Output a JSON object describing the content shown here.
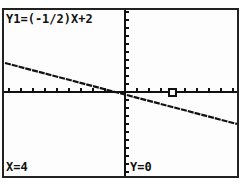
{
  "screen": {
    "equation": "Y1=(-1/2)X+2",
    "trace_x": "X=4",
    "trace_y": "Y=0"
  },
  "graph": {
    "function": "y = -0.5x + 2",
    "x_axis_y_px": 82,
    "y_axis_x_px": 121,
    "trace_point": {
      "x": 4,
      "y": 0
    },
    "colors": {
      "line": "#111111",
      "axes": "#111111",
      "background": "#fdfdfd",
      "border": "#222222"
    }
  }
}
